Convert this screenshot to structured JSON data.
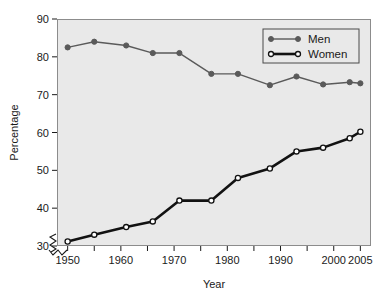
{
  "chart_data": {
    "type": "line",
    "title": "",
    "xlabel": "Year",
    "ylabel": "Percentage",
    "xlim": [
      1948,
      2007
    ],
    "ylim": [
      30,
      90
    ],
    "xticks": [
      1950,
      1960,
      1970,
      1980,
      1990,
      2000,
      2005
    ],
    "xtick_labels": [
      "1950",
      "1960",
      "1970",
      "1980",
      "1990",
      "2000",
      "2005"
    ],
    "yticks": [
      30,
      40,
      50,
      60,
      70,
      80,
      90
    ],
    "ytick_labels": [
      "30",
      "40",
      "50",
      "60",
      "70",
      "80",
      "90"
    ],
    "grid": false,
    "axis_break": true,
    "legend_position": "top-right",
    "legend_entries": [
      "Men",
      "Women"
    ],
    "series": [
      {
        "name": "Men",
        "marker": "filled-circle",
        "color": "#5a5a5a",
        "line_width": 1.4,
        "x": [
          1950,
          1955,
          1961,
          1966,
          1971,
          1977,
          1982,
          1988,
          1993,
          1998,
          2003,
          2005
        ],
        "values": [
          82.5,
          84.0,
          83.0,
          81.0,
          81.0,
          75.5,
          75.5,
          72.5,
          74.8,
          72.7,
          73.3,
          73.0
        ]
      },
      {
        "name": "Women",
        "marker": "open-circle",
        "color": "#121212",
        "line_width": 2.6,
        "x": [
          1950,
          1955,
          1961,
          1966,
          1971,
          1977,
          1982,
          1988,
          1993,
          1998,
          2003,
          2005
        ],
        "values": [
          31.2,
          33.0,
          35.0,
          36.5,
          42.0,
          42.0,
          48.0,
          50.5,
          55.0,
          56.0,
          58.5,
          60.2
        ]
      }
    ]
  },
  "style": {
    "plot_background": "#e9e9e9",
    "page_background": "#ffffff",
    "frame_color": "#8c8c8c",
    "men_color": "#5a5a5a",
    "women_color": "#121212"
  },
  "axes": {
    "y_title": "Percentage",
    "x_title": "Year"
  }
}
